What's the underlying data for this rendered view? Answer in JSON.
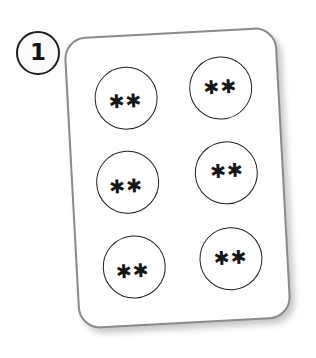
{
  "figure": {
    "background_color": "#ffffff"
  },
  "step_badge": {
    "name": "step-number-badge",
    "number": "1",
    "shape": "circle",
    "stroke_color": "#1d1d1d",
    "fill_color": "#fbfbfb"
  },
  "card": {
    "name": "blister-pack-card",
    "shape": "rounded-rectangle",
    "rotation_degrees": -3.1,
    "stroke_color": "#8a8a8a",
    "fill_color": "#ffffff",
    "shadow_color": "#bdbdbd",
    "columns": 2,
    "rows": 3
  },
  "holes": [
    {
      "name": "pack-hole-1",
      "row": 1,
      "column": 1,
      "marks": "✱✱",
      "mark_count": 2,
      "stroke_color": "#1e1e1e"
    },
    {
      "name": "pack-hole-2",
      "row": 1,
      "column": 2,
      "marks": "✱✱",
      "mark_count": 2,
      "stroke_color": "#1e1e1e"
    },
    {
      "name": "pack-hole-3",
      "row": 2,
      "column": 1,
      "marks": "✱✱",
      "mark_count": 2,
      "stroke_color": "#1e1e1e"
    },
    {
      "name": "pack-hole-4",
      "row": 2,
      "column": 2,
      "marks": "✱✱",
      "mark_count": 2,
      "stroke_color": "#1e1e1e"
    },
    {
      "name": "pack-hole-5",
      "row": 3,
      "column": 1,
      "marks": "✱✱",
      "mark_count": 2,
      "stroke_color": "#1e1e1e"
    },
    {
      "name": "pack-hole-6",
      "row": 3,
      "column": 2,
      "marks": "✱✱",
      "mark_count": 2,
      "stroke_color": "#1e1e1e"
    }
  ]
}
